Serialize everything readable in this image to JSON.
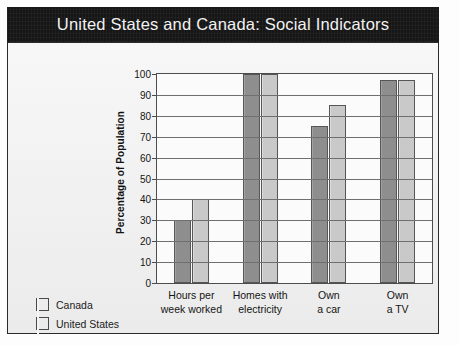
{
  "header": {
    "title": "United States and Canada: Social Indicators"
  },
  "legend": {
    "items": [
      {
        "label": "Canada",
        "color": "#8e8e8e"
      },
      {
        "label": "United States",
        "color": "#c9c9c9"
      }
    ]
  },
  "axis": {
    "y_title": "Percentage of Population",
    "ticks": [
      "100",
      "90",
      "80",
      "70",
      "60",
      "50",
      "40",
      "30",
      "20",
      "10",
      "0"
    ]
  },
  "chart_data": {
    "type": "bar",
    "title": "United States and Canada: Social Indicators",
    "xlabel": "",
    "ylabel": "Percentage of Population",
    "ylim": [
      0,
      100
    ],
    "ytick_step": 10,
    "grid": true,
    "legend_position": "left",
    "categories": [
      "Hours per week worked",
      "Homes with electricity",
      "Own a car",
      "Own a TV"
    ],
    "category_lines": [
      [
        "Hours per",
        "week worked"
      ],
      [
        "Homes with",
        "electricity"
      ],
      [
        "Own",
        "a car"
      ],
      [
        "Own",
        "a TV"
      ]
    ],
    "series": [
      {
        "name": "Canada",
        "color": "#8e8e8e",
        "values": [
          30,
          100,
          75,
          97
        ]
      },
      {
        "name": "United States",
        "color": "#c9c9c9",
        "values": [
          40,
          100,
          85,
          97
        ]
      }
    ]
  }
}
